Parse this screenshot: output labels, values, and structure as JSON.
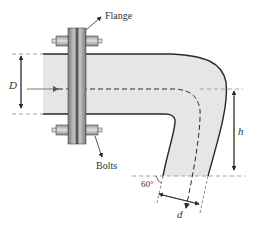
{
  "diagram": {
    "labels": {
      "flange": "Flange",
      "bolts": "Bolts",
      "inlet_diameter": "D",
      "outlet_diameter": "d",
      "height": "h",
      "angle": "60°"
    },
    "colors": {
      "pipe_fill": "#e6e6e6",
      "outline": "#2a2a2a",
      "dashed": "#8a8a8a",
      "flange_dark": "#6e6e6e",
      "flange_light": "#bdbdbd"
    }
  }
}
